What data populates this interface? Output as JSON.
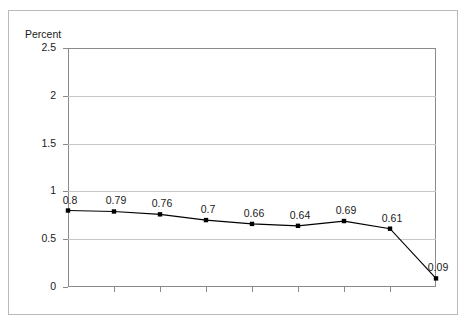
{
  "chart_data": {
    "type": "line",
    "title": "",
    "ylabel": "Percent",
    "xlabel": "",
    "categories": [
      "1979",
      "1980",
      "1981",
      "1982",
      "1983",
      "1984",
      "1985",
      "1986",
      "1987"
    ],
    "values": [
      0.8,
      0.79,
      0.76,
      0.7,
      0.66,
      0.64,
      0.69,
      0.61,
      0.09
    ],
    "point_labels": [
      "0.8",
      "0.79",
      "0.76",
      "0.7",
      "0.66",
      "0.64",
      "0.69",
      "0.61",
      "0.09"
    ],
    "ylim": [
      0,
      2.5
    ],
    "yticks": [
      0,
      0.5,
      1,
      1.5,
      2,
      2.5
    ],
    "ytick_labels": [
      "0",
      "0.5",
      "1",
      "1.5",
      "2",
      "2.5"
    ],
    "grid": true,
    "legend": "none",
    "series_color": "#000000",
    "marker": "square",
    "gridline_color": "#c8c8c8",
    "axis_color": "#8a8a8a"
  }
}
